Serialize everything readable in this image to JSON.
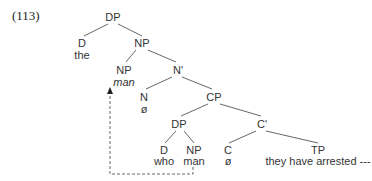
{
  "example_number": "(113)",
  "tree": {
    "nodes": {
      "dp_root": {
        "label": "DP"
      },
      "d_top": {
        "label": "D",
        "word": "the"
      },
      "np_top": {
        "label": "NP"
      },
      "np_head": {
        "label": "NP",
        "word": "man"
      },
      "n_bar": {
        "label": "N'"
      },
      "n": {
        "label": "N",
        "word": "ø"
      },
      "cp": {
        "label": "CP"
      },
      "dp_wh": {
        "label": "DP"
      },
      "c_bar": {
        "label": "C'"
      },
      "d_wh": {
        "label": "D",
        "word": "who"
      },
      "np_wh": {
        "label": "NP",
        "word": "man"
      },
      "c": {
        "label": "C",
        "word": "ø"
      },
      "tp": {
        "label": "TP",
        "word": "they have arrested ---"
      }
    },
    "movement": {
      "from": "np_wh",
      "to": "np_head",
      "style": "dashed-arrow"
    }
  }
}
